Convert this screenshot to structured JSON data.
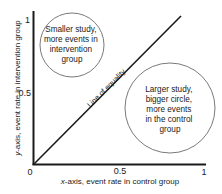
{
  "diagram": {
    "type": "scatter-concept",
    "axes": {
      "x": {
        "label_italic": "x",
        "label_rest": "-axis, event rate in control group",
        "ticks": [
          "0",
          "0.5",
          "1"
        ]
      },
      "y": {
        "label_italic": "y",
        "label_rest": "-axis, event rate in intervention group",
        "ticks": [
          "0.5",
          "1"
        ]
      }
    },
    "line_of_equality": {
      "label": "Line of equality"
    },
    "small_circle": {
      "lines": [
        "Smaller study,",
        "more events in",
        "intervention",
        "group"
      ]
    },
    "large_circle": {
      "lines": [
        "Larger study,",
        "bigger circle,",
        "more events",
        "in the control",
        "group"
      ]
    },
    "colors": {
      "axis": "#1a1a1a",
      "circle_stroke": "#7a7a7a",
      "text": "#1a1a1a",
      "background": "#ffffff"
    }
  }
}
